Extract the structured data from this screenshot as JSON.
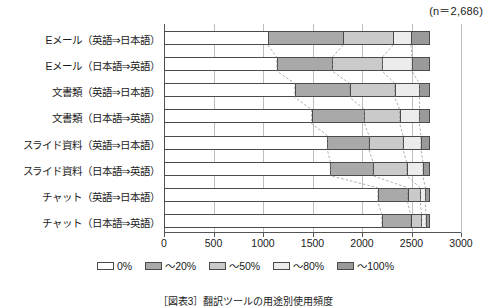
{
  "annotation": {
    "sample_size_label": "(n＝2,686)"
  },
  "caption": {
    "text": "［図表3］翻訳ツールの用途別使用頻度"
  },
  "legend": {
    "position": "bottom-center",
    "items": [
      {
        "label": "0%",
        "color": "#ffffff"
      },
      {
        "label": "～20%",
        "color": "#a9a9a9"
      },
      {
        "label": "～50%",
        "color": "#cacaca"
      },
      {
        "label": "～80%",
        "color": "#ececec"
      },
      {
        "label": "～100%",
        "color": "#9a9a9a"
      }
    ]
  },
  "chart_data": {
    "type": "bar",
    "orientation": "horizontal",
    "stacked": true,
    "title": "",
    "subtitle": "",
    "xlabel": "",
    "ylabel": "",
    "xlim": [
      0,
      3000
    ],
    "ylim": null,
    "grid": true,
    "total": 2686,
    "xticks": [
      0,
      500,
      1000,
      1500,
      2000,
      2500,
      3000
    ],
    "xticklabels": [
      "0",
      "500",
      "1000",
      "1500",
      "2000",
      "2500",
      "3000"
    ],
    "categories": [
      "Eメール（英語⇒日本語）",
      "Eメール（日本語⇒英語）",
      "文書類（英語⇒日本語）",
      "文書類（日本語⇒英語）",
      "スライド資料（英語⇒日本語）",
      "スライド資料（日本語⇒英語）",
      "チャット（英語⇒日本語）",
      "チャット（日本語⇒英語）"
    ],
    "series": [
      {
        "name": "0%",
        "color": "#ffffff",
        "values": [
          1050,
          1140,
          1320,
          1490,
          1650,
          1680,
          2160,
          2200
        ]
      },
      {
        "name": "～20%",
        "color": "#a9a9a9",
        "values": [
          760,
          560,
          555,
          535,
          420,
          430,
          300,
          290
        ]
      },
      {
        "name": "～50%",
        "color": "#cacaca",
        "values": [
          505,
          505,
          455,
          355,
          345,
          340,
          130,
          110
        ]
      },
      {
        "name": "～80%",
        "color": "#ececec",
        "values": [
          180,
          300,
          250,
          200,
          180,
          165,
          50,
          45
        ]
      },
      {
        "name": "～100%",
        "color": "#9a9a9a",
        "values": [
          191,
          181,
          106,
          106,
          91,
          71,
          46,
          41
        ]
      }
    ]
  }
}
